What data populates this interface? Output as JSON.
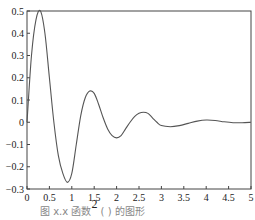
{
  "chart_data": {
    "type": "line",
    "title": "",
    "xlabel": "",
    "ylabel": "",
    "xlim": [
      0,
      5
    ],
    "ylim": [
      -0.3,
      0.5
    ],
    "grid": false,
    "x_ticks": [
      0,
      0.5,
      1,
      1.5,
      2,
      2.5,
      3,
      3.5,
      4,
      4.5,
      5
    ],
    "x_tick_labels": [
      "0",
      "0.5",
      "1",
      "1.5",
      "2",
      "2.5",
      "3",
      "3.5",
      "4",
      "4.5",
      "5"
    ],
    "y_ticks": [
      0.5,
      0.4,
      0.3,
      0.2,
      0.1,
      0,
      -0.1,
      -0.2,
      -0.3
    ],
    "y_tick_labels": [
      "0.5",
      "0.4",
      "0.3",
      "0.2",
      "0.1",
      "0",
      "−0.1",
      "−0.2",
      "−0.3"
    ],
    "series": [
      {
        "name": "y",
        "color": "#555555",
        "x": [
          0,
          0.1,
          0.2,
          0.3,
          0.4,
          0.5,
          0.6,
          0.7,
          0.8,
          0.9,
          1.0,
          1.1,
          1.2,
          1.3,
          1.4,
          1.5,
          1.6,
          1.7,
          1.8,
          1.9,
          2.0,
          2.1,
          2.2,
          2.3,
          2.4,
          2.5,
          2.6,
          2.7,
          2.8,
          2.9,
          3.0,
          3.2,
          3.4,
          3.6,
          3.8,
          4.0,
          4.2,
          4.4,
          4.6,
          4.8,
          5.0
        ],
        "y": [
          0,
          0.3,
          0.46,
          0.5,
          0.4,
          0.2,
          0.0,
          -0.15,
          -0.23,
          -0.27,
          -0.23,
          -0.1,
          0.03,
          0.11,
          0.14,
          0.13,
          0.08,
          0.02,
          -0.03,
          -0.06,
          -0.07,
          -0.06,
          -0.03,
          0.0,
          0.025,
          0.04,
          0.045,
          0.04,
          0.02,
          0.0,
          -0.015,
          -0.02,
          -0.015,
          -0.005,
          0.005,
          0.01,
          0.008,
          0.002,
          -0.002,
          -0.002,
          0.0
        ]
      }
    ]
  },
  "caption": {
    "prefix": "图 x.x  函数",
    "superscript": "2",
    "suffix": "  ( ) 的图形"
  }
}
